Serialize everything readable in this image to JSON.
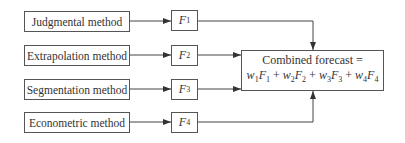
{
  "methods": [
    {
      "label": "Judgmental method",
      "forecast": "F",
      "sub": "1"
    },
    {
      "label": "Extrapolation method",
      "forecast": "F",
      "sub": "2"
    },
    {
      "label": "Segmentation method",
      "forecast": "F",
      "sub": "3"
    },
    {
      "label": "Econometric method",
      "forecast": "F",
      "sub": "4"
    }
  ],
  "combined": {
    "title": "Combined forecast =",
    "terms": [
      {
        "w": "w",
        "ws": "1",
        "f": "F",
        "fs": "1"
      },
      {
        "w": "w",
        "ws": "2",
        "f": "F",
        "fs": "2"
      },
      {
        "w": "w",
        "ws": "3",
        "f": "F",
        "fs": "3"
      },
      {
        "w": "w",
        "ws": "4",
        "f": "F",
        "fs": "4"
      }
    ],
    "plus": "+"
  }
}
